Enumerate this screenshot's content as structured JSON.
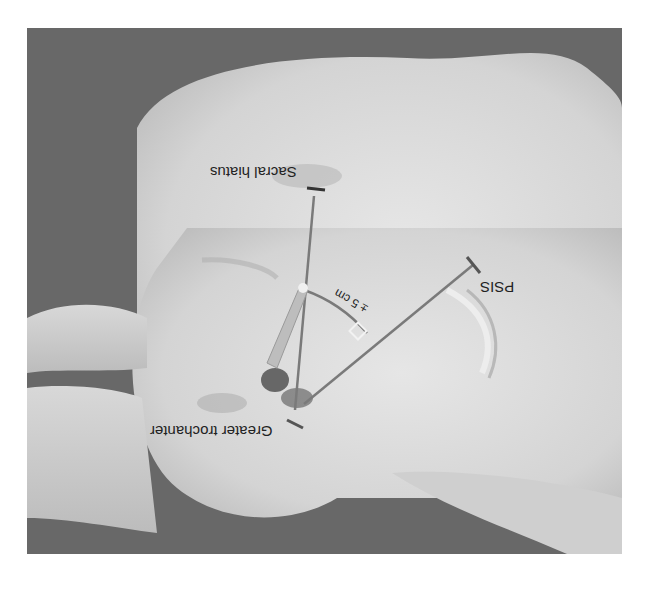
{
  "figure": {
    "orientation": "rotated 180 degrees",
    "colors": {
      "background": "#ffffff",
      "backdrop": "#6a6a6a",
      "skin": "#dcdcdc",
      "lines": "#7a7a7a"
    },
    "labels": {
      "sacral_hiatus": "Sacral hiatus",
      "psis": "PSIS",
      "greater_trochanter": "Greater trochanter",
      "distance": "± 5 cm"
    }
  }
}
